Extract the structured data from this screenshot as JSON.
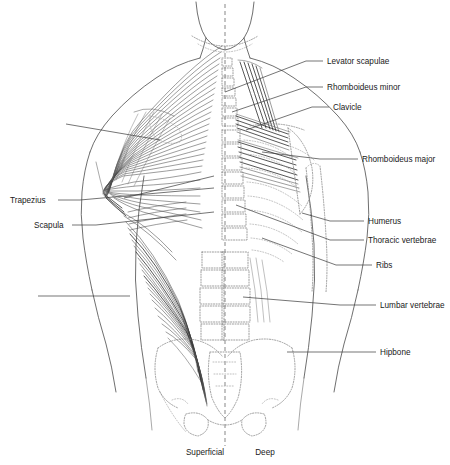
{
  "figure": {
    "background_color": "#ffffff",
    "ink_color": "#1a1a1a",
    "width": 450,
    "height": 465
  },
  "captions": [
    {
      "id": "superficial",
      "text": "Superficial",
      "x": 205,
      "y": 455
    },
    {
      "id": "deep",
      "text": "Deep",
      "x": 265,
      "y": 455
    }
  ],
  "labels": [
    {
      "id": "levator-scapulae",
      "text": "Levator scapulae",
      "side": "right",
      "text_x": 327,
      "text_y": 64,
      "leader": "M 323 61 L 306 61 L 225 92"
    },
    {
      "id": "rhomboideus-minor",
      "text": "Rhomboideus minor",
      "side": "right",
      "text_x": 327,
      "text_y": 90,
      "leader": "M 323 87 L 306 87 L 232 112"
    },
    {
      "id": "clavicle",
      "text": "Clavicle",
      "side": "right",
      "text_x": 333,
      "text_y": 110,
      "leader": "M 329 107 L 312 107 L 246 130"
    },
    {
      "id": "rhomboideus-major",
      "text": "Rhomboideus major",
      "side": "right",
      "text_x": 362,
      "text_y": 162,
      "leader": "M 358 159 L 320 159 L 262 152"
    },
    {
      "id": "humerus",
      "text": "Humerus",
      "side": "right",
      "text_x": 368,
      "text_y": 224,
      "leader": "M 364 221 L 330 221 L 302 213"
    },
    {
      "id": "thoracic-vertebrae",
      "text": "Thoracic vertebrae",
      "side": "right",
      "text_x": 368,
      "text_y": 243,
      "leader": "M 364 240 L 330 240 L 236 205"
    },
    {
      "id": "ribs",
      "text": "Ribs",
      "side": "right",
      "text_x": 376,
      "text_y": 268,
      "leader": "M 372 265 L 336 265 L 262 238"
    },
    {
      "id": "lumbar-vertebrae",
      "text": "Lumbar vertebrae",
      "side": "right",
      "text_x": 380,
      "text_y": 308,
      "leader": "M 376 305 L 340 305 L 243 297"
    },
    {
      "id": "hipbone",
      "text": "Hipbone",
      "side": "right",
      "text_x": 380,
      "text_y": 355,
      "leader": "M 376 352 L 340 352 L 287 352"
    },
    {
      "id": "trapezius",
      "text": "Trapezius",
      "side": "left",
      "text_x": 10,
      "text_y": 203,
      "leader": "M 58 200 L 80 200 L 214 188"
    },
    {
      "id": "scapula",
      "text": "Scapula",
      "side": "left",
      "text_x": 34,
      "text_y": 228,
      "leader": "M 72 225 L 96 225 L 214 212"
    },
    {
      "id": "deltoid-pointer",
      "text": "",
      "side": "left",
      "text_x": 0,
      "text_y": 0,
      "leader": "M 66 124 L 160 140"
    },
    {
      "id": "latissimus-pointer",
      "text": "",
      "side": "left",
      "text_x": 0,
      "text_y": 0,
      "leader": "M 38 296 L 130 296"
    },
    {
      "id": "teres-pointer",
      "text": "",
      "side": "left",
      "text_x": 0,
      "text_y": 0,
      "leader": "M 124 198 L 214 176"
    }
  ],
  "regions": {
    "left_half_label": "Superficial muscle layer",
    "right_half_label": "Deep muscle and skeletal layer",
    "midline_x": 225
  }
}
